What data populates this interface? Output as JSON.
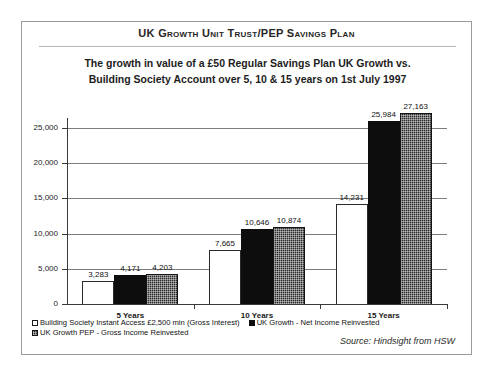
{
  "header": {
    "title": "UK Growth Unit Trust/PEP Savings Plan",
    "subtitle_line1": "The growth in value of a £50 Regular Savings Plan UK Growth vs.",
    "subtitle_line2": "Building Society Account over 5, 10 & 15 years on 1st July 1997"
  },
  "footer": {
    "source": "Source: Hindsight from HSW"
  },
  "chart_data": {
    "type": "bar",
    "title": "UK Growth Unit Trust/PEP Savings Plan",
    "subtitle": "The growth in value of a £50 Regular Savings Plan UK Growth vs. Building Society Account over 5, 10 & 15 years on 1st July 1997",
    "xlabel": "",
    "ylabel": "",
    "categories": [
      "5 Years",
      "10 Years",
      "15 Years"
    ],
    "ylim": [
      0,
      27500
    ],
    "yticks": [
      0,
      5000,
      10000,
      15000,
      20000,
      25000
    ],
    "ytick_labels": [
      "0",
      "5,000",
      "10,000",
      "15,000",
      "20,000",
      "25,000"
    ],
    "grid": true,
    "legend_position": "bottom-left",
    "series": [
      {
        "name": "Building Society Instant Access £2,500 min (Gross Interest)",
        "swatch": "white-open",
        "values": [
          3283,
          4171,
          4203
        ],
        "value_labels": [
          "3,283",
          "4,171",
          "4,203"
        ]
      },
      {
        "name": "UK Growth - Net Income Reinvested",
        "swatch": "solid-black",
        "values": [
          7665,
          10646,
          10874
        ],
        "value_labels": [
          "7,665",
          "10,646",
          "10,874"
        ]
      },
      {
        "name": "UK Growth PEP - Gross Income Reinvested",
        "swatch": "dark-checker",
        "values": [
          14231,
          25984,
          27163
        ],
        "value_labels": [
          "14,231",
          "25,984",
          "27,163"
        ]
      }
    ],
    "groups": [
      {
        "category": "5 Years",
        "bars": [
          {
            "series": "Building Society Instant Access £2,500 min (Gross Interest)",
            "value": 3283,
            "label": "3,283"
          },
          {
            "series": "UK Growth - Net Income Reinvested",
            "value": 4171,
            "label": "4,171"
          },
          {
            "series": "UK Growth PEP - Gross Income Reinvested",
            "value": 4203,
            "label": "4,203"
          }
        ]
      },
      {
        "category": "10 Years",
        "bars": [
          {
            "series": "Building Society Instant Access £2,500 min (Gross Interest)",
            "value": 7665,
            "label": "7,665"
          },
          {
            "series": "UK Growth - Net Income Reinvested",
            "value": 10646,
            "label": "10,646"
          },
          {
            "series": "UK Growth PEP - Gross Income Reinvested",
            "value": 10874,
            "label": "10,874"
          }
        ]
      },
      {
        "category": "15 Years",
        "bars": [
          {
            "series": "Building Society Instant Access £2,500 min (Gross Interest)",
            "value": 14231,
            "label": "14,231"
          },
          {
            "series": "UK Growth - Net Income Reinvested",
            "value": 25984,
            "label": "25,984"
          },
          {
            "series": "UK Growth PEP - Gross Income Reinvested",
            "value": 27163,
            "label": "27,163"
          }
        ]
      }
    ]
  },
  "colors": {
    "frame": "#9a9a9a",
    "axis": "#3a3a3a",
    "gridline": "#7d7d7d",
    "series_white": "#ffffff",
    "series_black": "#0d0d0d",
    "series_checker": "#2b2b2b",
    "text": "#1a1a1a"
  }
}
